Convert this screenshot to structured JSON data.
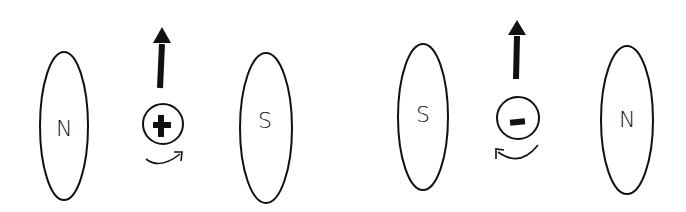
{
  "diagram": {
    "panels": [
      {
        "left_magnet": {
          "label": "N"
        },
        "right_magnet": {
          "label": "S"
        },
        "charge": {
          "sign": "+",
          "symbol": "plus"
        },
        "force_arrow": {
          "direction": "up"
        },
        "rotation": {
          "direction": "clockwise"
        }
      },
      {
        "left_magnet": {
          "label": "S"
        },
        "right_magnet": {
          "label": "N"
        },
        "charge": {
          "sign": "-",
          "symbol": "minus"
        },
        "force_arrow": {
          "direction": "up"
        },
        "rotation": {
          "direction": "counterclockwise"
        }
      }
    ],
    "colors": {
      "ink": "#111111",
      "background": "#ffffff"
    }
  }
}
